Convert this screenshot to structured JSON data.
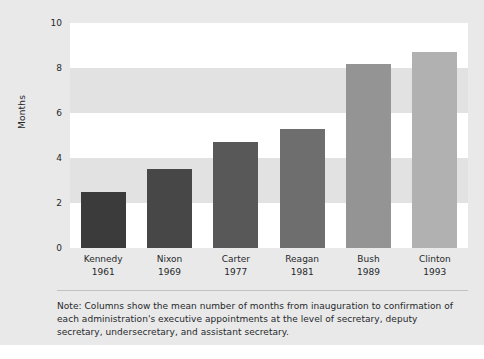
{
  "chart_data": {
    "type": "bar",
    "title": "",
    "subtitle": "",
    "xlabel": "",
    "ylabel": "Months",
    "ylim": [
      0,
      10
    ],
    "yticks": [
      0,
      2,
      4,
      6,
      8,
      10
    ],
    "ytick_labels": [
      "0",
      "2",
      "4",
      "6",
      "8",
      "10"
    ],
    "grid": false,
    "banded_background": true,
    "legend": null,
    "categories": [
      "Kennedy",
      "Nixon",
      "Carter",
      "Reagan",
      "Bush",
      "Clinton"
    ],
    "category_sublabels": [
      "1961",
      "1969",
      "1977",
      "1981",
      "1989",
      "1993"
    ],
    "values": [
      2.5,
      3.5,
      4.7,
      5.3,
      8.2,
      8.7
    ],
    "bar_colors": [
      "#3b3b3b",
      "#474747",
      "#585858",
      "#6e6e6e",
      "#949494",
      "#b1b1b1"
    ],
    "bars": [
      {
        "label": "Kennedy",
        "sublabel": "1961",
        "value": 2.5,
        "color": "#3b3b3b"
      },
      {
        "label": "Nixon",
        "sublabel": "1969",
        "value": 3.5,
        "color": "#474747"
      },
      {
        "label": "Carter",
        "sublabel": "1977",
        "value": 4.7,
        "color": "#585858"
      },
      {
        "label": "Reagan",
        "sublabel": "1981",
        "value": 5.3,
        "color": "#6e6e6e"
      },
      {
        "label": "Bush",
        "sublabel": "1989",
        "value": 8.2,
        "color": "#949494"
      },
      {
        "label": "Clinton",
        "sublabel": "1993",
        "value": 8.7,
        "color": "#b1b1b1"
      }
    ],
    "annotations": [
      "Note: Columns show the mean number of months from inauguration to confirmation of each administration's executive appointments at the level of secretary, deputy secretary, undersecretary, and assistant secretary."
    ]
  },
  "note": {
    "text": "Note: Columns show the mean number of months from inauguration to confirmation of each administration's executive appointments at the level of secretary, deputy secretary, undersecretary, and assistant secretary."
  },
  "colors": {
    "page_background": "#e9e9e9",
    "plot_background": "#ffffff",
    "band": "#e2e2e2",
    "text": "#26282b",
    "divider": "#c2c2c2"
  }
}
